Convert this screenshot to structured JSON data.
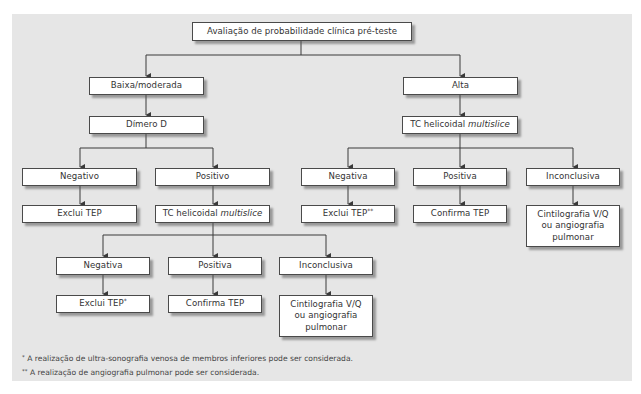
{
  "diagram": {
    "background_color": "#e6e6e6",
    "box_border_color": "#4a4a4a",
    "nodes": {
      "root": "Avaliação de probabilidade clínica pré-teste",
      "low": "Baixa/moderada",
      "high": "Alta",
      "dimer": "Dímero D",
      "ct_high": {
        "prefix": "TC helicoidal ",
        "italic": "multislice"
      },
      "dimer_neg": "Negativo",
      "dimer_pos": "Positivo",
      "dimer_neg_result": "Exclui TEP",
      "ct_low": {
        "prefix": "TC helicoidal ",
        "italic": "multislice"
      },
      "ct_high_neg": "Negativa",
      "ct_high_pos": "Positiva",
      "ct_high_inc": "Inconclusiva",
      "ct_high_neg_result": {
        "text": "Exclui TEP",
        "mark": "**"
      },
      "ct_high_pos_result": "Confirma TEP",
      "ct_high_inc_result": [
        "Cintilografia V/Q",
        "ou angiografia",
        "pulmonar"
      ],
      "ct_low_neg": "Negativa",
      "ct_low_pos": "Positiva",
      "ct_low_inc": "Inconclusiva",
      "ct_low_neg_result": {
        "text": "Exclui TEP",
        "mark": "*"
      },
      "ct_low_pos_result": "Confirma TEP",
      "ct_low_inc_result": [
        "Cintilografia V/Q",
        "ou angiografia",
        "pulmonar"
      ]
    },
    "footnotes": [
      {
        "mark": "*",
        "text": "A realização de ultra-sonografia venosa de membros inferiores pode ser considerada."
      },
      {
        "mark": "**",
        "text": "A realização de angiografia pulmonar pode ser considerada."
      }
    ]
  }
}
